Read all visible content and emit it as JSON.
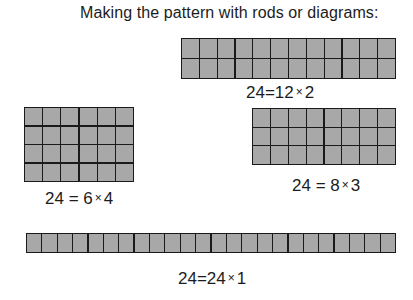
{
  "title": "Making the pattern with rods or diagrams:",
  "colors": {
    "cell_fill": "#a8a8a8",
    "cell_border": "#1a1a1a",
    "text": "#1c1c1c",
    "background": "#ffffff"
  },
  "diagrams": [
    {
      "id": "12x2",
      "columns": 12,
      "rows": 2,
      "total": 24,
      "equation": {
        "lhs": "24",
        "eq": "=",
        "a": "12",
        "times": "×",
        "b": "2"
      }
    },
    {
      "id": "6x4",
      "columns": 6,
      "rows": 4,
      "total": 24,
      "equation": {
        "lhs": "24",
        "eq": "=",
        "a": "6",
        "times": "×",
        "b": "4"
      }
    },
    {
      "id": "8x3",
      "columns": 8,
      "rows": 3,
      "total": 24,
      "equation": {
        "lhs": "24",
        "eq": "=",
        "a": "8",
        "times": "×",
        "b": "3"
      }
    },
    {
      "id": "24x1",
      "columns": 24,
      "rows": 1,
      "total": 24,
      "equation": {
        "lhs": "24",
        "eq": "=",
        "a": "24",
        "times": "×",
        "b": "1"
      }
    }
  ]
}
